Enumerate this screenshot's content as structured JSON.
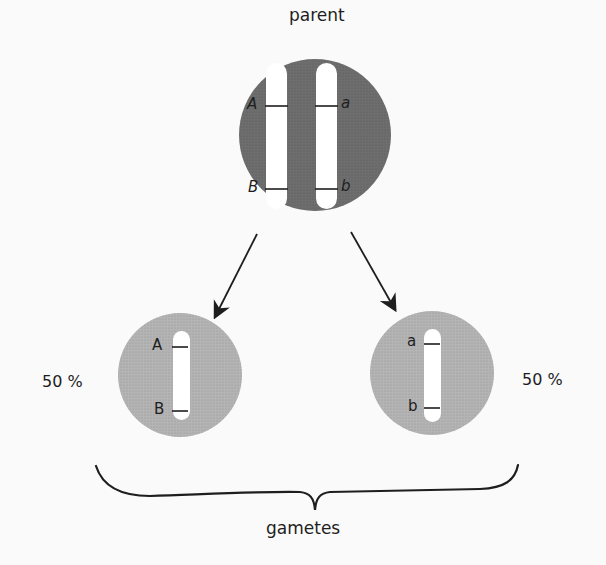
{
  "title": "parent",
  "footer_label": "gametes",
  "colors": {
    "parent_cell": "#6e6e6e",
    "gamete_cell": "#b4b4b4",
    "chromosome": "#ffffff",
    "ink": "#1e1e1e",
    "background": "#fafafa"
  },
  "parent": {
    "chromosomes": [
      {
        "top_allele": "A",
        "bottom_allele": "B"
      },
      {
        "top_allele": "a",
        "bottom_allele": "b"
      }
    ]
  },
  "gametes": [
    {
      "top_allele": "A",
      "bottom_allele": "B",
      "percent": "50 %"
    },
    {
      "top_allele": "a",
      "bottom_allele": "b",
      "percent": "50 %"
    }
  ]
}
